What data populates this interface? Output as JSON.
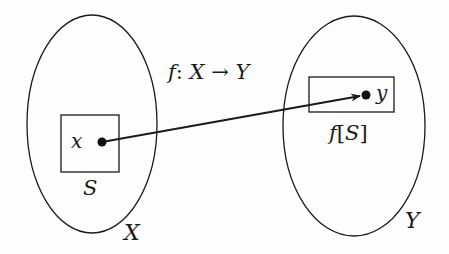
{
  "diagram": {
    "title": "f: X → Y",
    "title_parts": {
      "f": "f",
      "colon": ":",
      "X": "X",
      "arrow": "→",
      "Y": "Y"
    },
    "domain_set": {
      "label": "X"
    },
    "codomain_set": {
      "label": "Y"
    },
    "subset": {
      "label": "S"
    },
    "image": {
      "label": "f[S]",
      "parts": {
        "f": "f",
        "open": "[",
        "S": "S",
        "close": "]"
      }
    },
    "element_x": {
      "label": "x"
    },
    "element_y": {
      "label": "y"
    },
    "colors": {
      "stroke": "#1a1a1a",
      "background": "#fefefe"
    }
  }
}
